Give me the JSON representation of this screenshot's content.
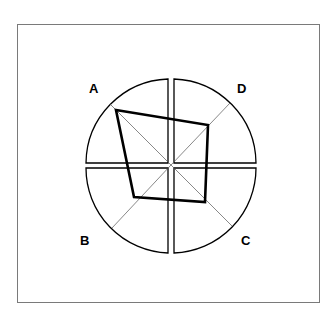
{
  "diagram": {
    "labels": {
      "a": "A",
      "b": "B",
      "c": "C",
      "d": "D"
    },
    "polygon_vertices": {
      "A": [
        116,
        110
      ],
      "D": [
        208,
        125
      ],
      "C": [
        205,
        202
      ],
      "B": [
        134,
        197
      ]
    },
    "colors": {
      "frame": "#7a7a7a",
      "outline": "#000000",
      "axis": "#555555",
      "polygon": "#000000"
    }
  }
}
